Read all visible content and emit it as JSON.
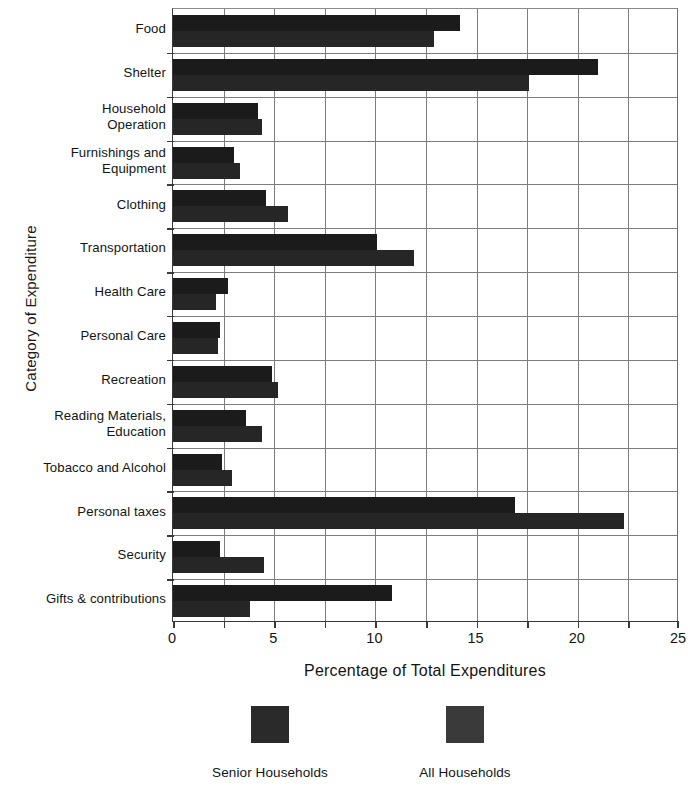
{
  "chart_data": {
    "type": "bar",
    "orientation": "horizontal",
    "title": "",
    "xlabel": "Percentage of Total Expenditures",
    "ylabel": "Category of Expenditure",
    "xlim": [
      0,
      25
    ],
    "xticks": [
      0,
      5,
      10,
      15,
      20,
      25
    ],
    "minor_tick_step": 2.5,
    "grid": true,
    "legend_position": "bottom",
    "categories": [
      "Food",
      "Shelter",
      "Household Operation",
      "Furnishings and Equipment",
      "Clothing",
      "Transportation",
      "Health Care",
      "Personal Care",
      "Recreation",
      "Reading Materials, Education",
      "Tobacco and Alcohol",
      "Personal taxes",
      "Security",
      "Gifts & contributions"
    ],
    "category_label_lines": [
      [
        "Food"
      ],
      [
        "Shelter"
      ],
      [
        "Household",
        "Operation"
      ],
      [
        "Furnishings and",
        "Equipment"
      ],
      [
        "Clothing"
      ],
      [
        "Transportation"
      ],
      [
        "Health Care"
      ],
      [
        "Personal Care"
      ],
      [
        "Recreation"
      ],
      [
        "Reading Materials,",
        "Education"
      ],
      [
        "Tobacco and Alcohol"
      ],
      [
        "Personal taxes"
      ],
      [
        "Security"
      ],
      [
        "Gifts & contributions"
      ]
    ],
    "series": [
      {
        "name": "Senior Households",
        "color": "#1b1b1b",
        "values": [
          14.2,
          21.0,
          4.2,
          3.0,
          4.6,
          10.1,
          2.7,
          2.3,
          4.9,
          3.6,
          2.4,
          16.9,
          2.3,
          10.8
        ]
      },
      {
        "name": "All Households",
        "color": "#262626",
        "values": [
          12.9,
          17.6,
          4.4,
          3.3,
          5.7,
          11.9,
          2.1,
          2.2,
          5.2,
          4.4,
          2.9,
          22.3,
          4.5,
          3.8
        ]
      }
    ]
  },
  "legend": {
    "items": [
      {
        "label": "Senior Households",
        "color": "#2a2a2a"
      },
      {
        "label": "All Households",
        "color": "#3a3a3a"
      }
    ]
  }
}
